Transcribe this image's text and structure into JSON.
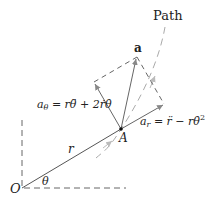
{
  "diagram": {
    "labels": {
      "path": "Path",
      "acceleration": "a",
      "a_theta_symbol": "a",
      "a_theta_sub": "θ",
      "a_theta_expr": " = rθ̈ + 2ṙθ̇",
      "a_r_symbol": "a",
      "a_r_sub": "r",
      "a_r_expr": " = r̈ − rθ̇",
      "a_r_sup": "2",
      "point_A": "A",
      "radius": "r",
      "angle": "θ",
      "origin": "O"
    },
    "colors": {
      "line": "#555555",
      "dashed": "#666666",
      "path_dashed": "#999999",
      "text": "#222222"
    },
    "points": {
      "O": [
        22,
        188
      ],
      "A": [
        121,
        129
      ],
      "a_tip": [
        137,
        57
      ],
      "a_r_tip": [
        164,
        104
      ],
      "a_theta_tip": [
        94,
        82
      ]
    }
  }
}
